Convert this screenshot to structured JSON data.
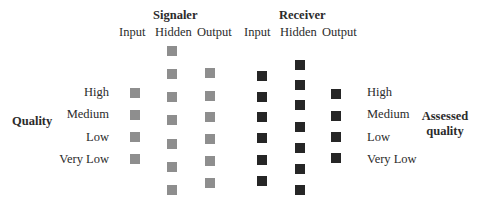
{
  "groups": {
    "signaler": {
      "title": "Signaler",
      "layers": [
        "Input",
        "Hidden",
        "Output"
      ],
      "color": "#8e8e8e"
    },
    "receiver": {
      "title": "Receiver",
      "layers": [
        "Input",
        "Hidden",
        "Output"
      ],
      "color": "#262626"
    }
  },
  "left": {
    "label": "Quality",
    "levels": [
      "High",
      "Medium",
      "Low",
      "Very Low"
    ]
  },
  "right": {
    "label_line1": "Assessed",
    "label_line2": "quality",
    "levels": [
      "High",
      "Medium",
      "Low",
      "Very Low"
    ]
  },
  "node_counts": {
    "signaler_input": 4,
    "signaler_hidden": 7,
    "signaler_output": 6,
    "receiver_input": 6,
    "receiver_hidden": 7,
    "receiver_output": 4
  }
}
